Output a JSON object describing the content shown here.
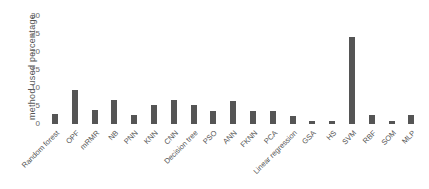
{
  "chart_data": {
    "type": "bar",
    "title": "",
    "xlabel": "",
    "ylabel": "method  used percentage",
    "ylim": [
      0,
      30
    ],
    "yticks": [
      0,
      5,
      10,
      15,
      20,
      25,
      30
    ],
    "grid": false,
    "legend": null,
    "bar_color": "#555555",
    "categories": [
      "Random forest",
      "OPF",
      "mRMR",
      "NB",
      "PNN",
      "KNN",
      "CNN",
      "Decision tree",
      "PSO",
      "ANN",
      "FKNN",
      "PCA",
      "Linear regression",
      "GSA",
      "HS",
      "SVM",
      "RBF",
      "SOM",
      "MLP"
    ],
    "values": [
      2.8,
      9.4,
      3.8,
      6.6,
      2.5,
      5.3,
      6.6,
      5.3,
      3.7,
      6.4,
      3.6,
      3.7,
      2.3,
      0.75,
      0.75,
      24.2,
      2.4,
      0.75,
      2.4
    ]
  }
}
